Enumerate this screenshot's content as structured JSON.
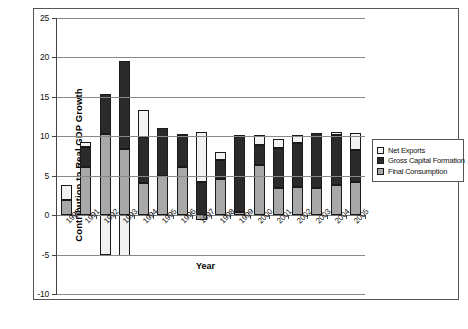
{
  "chart_data": {
    "type": "bar",
    "stacked": true,
    "title": "",
    "xlabel": "Year",
    "ylabel": "Contribution to Real GDP Growth",
    "ylim": [
      -10,
      25
    ],
    "yticks": [
      -10,
      -5,
      0,
      5,
      10,
      15,
      20,
      25
    ],
    "ytick_labels": [
      "-10",
      "-5",
      "0",
      "5",
      "10",
      "15",
      "20",
      "25"
    ],
    "grid": true,
    "legend_position": "right",
    "categories": [
      "1990",
      "1991",
      "1992",
      "1993",
      "1994",
      "1995",
      "1996",
      "1997",
      "1998",
      "1999",
      "2000",
      "2001",
      "2002",
      "2003",
      "2004",
      "2005"
    ],
    "series": [
      {
        "name": "Final Consumption",
        "color": "#a8a8a8",
        "values": [
          1.9,
          6.1,
          10.3,
          8.4,
          4.1,
          5.0,
          6.1,
          -0.6,
          4.6,
          0.4,
          6.3,
          3.4,
          3.6,
          3.4,
          3.8,
          4.2
        ]
      },
      {
        "name": "Gross Capital Formation",
        "color": "#2b2b2b",
        "values": [
          0.0,
          2.5,
          5.0,
          11.1,
          5.8,
          6.1,
          3.9,
          4.2,
          2.4,
          9.7,
          2.6,
          5.1,
          5.6,
          7.0,
          6.4,
          4.0
        ]
      },
      {
        "name": "Net Exports",
        "color": "#f2f2f2",
        "values": [
          1.9,
          0.7,
          -5.1,
          -5.2,
          3.4,
          0.0,
          0.3,
          6.4,
          1.0,
          0.0,
          1.2,
          1.2,
          1.0,
          0.0,
          0.4,
          2.2
        ]
      }
    ]
  },
  "legend": {
    "items": [
      {
        "label": "Net Exports",
        "key": "ne"
      },
      {
        "label": "Gross Capital Formation",
        "key": "gcf"
      },
      {
        "label": "Final Consumption",
        "key": "fc"
      }
    ]
  }
}
